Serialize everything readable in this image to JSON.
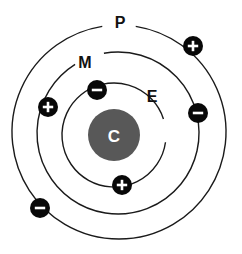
{
  "diagram": {
    "type": "atomic-model",
    "background_color": "#ffffff",
    "center": {
      "x": 119,
      "y": 131
    },
    "nucleus": {
      "label": "C",
      "label_color": "#ffffff",
      "fill_color": "#585858",
      "radius": 26,
      "cx": 114,
      "cy": 135,
      "name": "nucleus"
    },
    "shells": [
      {
        "id": "inner",
        "label": "E",
        "label_x": 152,
        "label_y": 96,
        "radius": 52,
        "cx": 114,
        "cy": 135,
        "stroke_color": "#1a1a1a",
        "stroke_width": 1.4,
        "gap_start_deg": -18,
        "gap_end_deg": 8
      },
      {
        "id": "middle",
        "label": "M",
        "label_x": 85,
        "label_y": 62,
        "radius": 81,
        "cx": 118,
        "cy": 133,
        "stroke_color": "#1a1a1a",
        "stroke_width": 1.4,
        "gap_start_deg": -122,
        "gap_end_deg": -100
      },
      {
        "id": "outer",
        "label": "P",
        "label_x": 120,
        "label_y": 22,
        "radius": 107,
        "cx": 119,
        "cy": 132,
        "stroke_color": "#1a1a1a",
        "stroke_width": 1.4,
        "gap_start_deg": -99,
        "gap_end_deg": -81
      }
    ],
    "particles": [
      {
        "id": "p1",
        "charge": "+",
        "shell": "outer",
        "cx": 193,
        "cy": 46,
        "radius": 10,
        "fill_color": "#080808",
        "glyph_color": "#ffffff",
        "name": "proton-outer-top-right"
      },
      {
        "id": "p2",
        "charge": "-",
        "shell": "middle",
        "cx": 198,
        "cy": 113,
        "radius": 10,
        "fill_color": "#080808",
        "glyph_color": "#ffffff",
        "name": "electron-middle-right"
      },
      {
        "id": "p3",
        "charge": "+",
        "shell": "middle",
        "cx": 48,
        "cy": 107,
        "radius": 10,
        "fill_color": "#080808",
        "glyph_color": "#ffffff",
        "name": "proton-middle-left"
      },
      {
        "id": "p4",
        "charge": "-",
        "shell": "outer",
        "cx": 40,
        "cy": 208,
        "radius": 10,
        "fill_color": "#080808",
        "glyph_color": "#ffffff",
        "name": "electron-outer-bottom-left"
      },
      {
        "id": "p5",
        "charge": "-",
        "shell": "inner",
        "cx": 97,
        "cy": 90,
        "radius": 10,
        "fill_color": "#080808",
        "glyph_color": "#ffffff",
        "name": "electron-inner-top"
      },
      {
        "id": "p6",
        "charge": "+",
        "shell": "inner",
        "cx": 122,
        "cy": 185,
        "radius": 10,
        "fill_color": "#080808",
        "glyph_color": "#ffffff",
        "name": "proton-inner-bottom"
      }
    ]
  }
}
